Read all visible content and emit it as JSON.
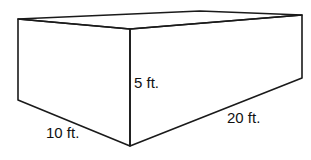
{
  "diagram": {
    "type": "rectangular-prism",
    "labels": {
      "height": "5 ft.",
      "width": "10 ft.",
      "length": "20 ft."
    },
    "colors": {
      "stroke": "#1a1a1a",
      "fill": "#ffffff"
    }
  }
}
